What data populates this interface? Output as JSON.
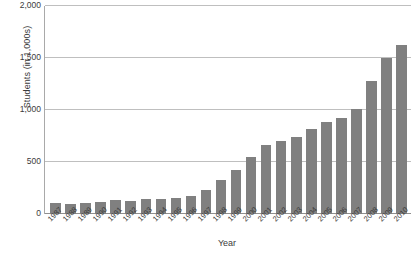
{
  "chart_data": {
    "type": "bar",
    "title": "",
    "xlabel": "Year",
    "ylabel": "Students (in 1,000s)",
    "ylim": [
      0,
      2000
    ],
    "y_ticks": [
      0,
      500,
      1000,
      1500,
      2000
    ],
    "y_tick_labels": [
      "0",
      "500",
      "1,000",
      "1,500",
      "2,000"
    ],
    "grid": true,
    "legend": "none",
    "bar_color": "#808080",
    "categories": [
      "1987",
      "1988",
      "1989",
      "1990",
      "1991",
      "1992",
      "1993",
      "1994",
      "1995",
      "1996",
      "1997",
      "1998",
      "1999",
      "2000",
      "2001",
      "2002",
      "2003",
      "2004",
      "2005",
      "2006",
      "2007",
      "2008",
      "2009",
      "2010"
    ],
    "values": [
      105,
      100,
      110,
      115,
      130,
      125,
      140,
      145,
      155,
      170,
      230,
      330,
      420,
      550,
      665,
      705,
      740,
      820,
      885,
      920,
      1010,
      1280,
      1500,
      1625
    ],
    "series": [
      {
        "name": "Students",
        "values": [
          105,
          100,
          110,
          115,
          130,
          125,
          140,
          145,
          155,
          170,
          230,
          330,
          420,
          550,
          665,
          705,
          740,
          820,
          885,
          920,
          1010,
          1280,
          1500,
          1625
        ]
      }
    ]
  },
  "footnote": {
    "text": ""
  }
}
